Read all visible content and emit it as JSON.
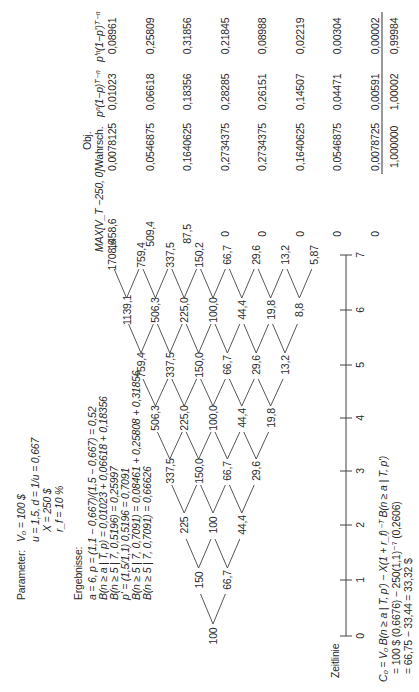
{
  "parameters": {
    "label": "Parameter:",
    "lines": [
      "V₀ = 100 $",
      "u = 1,5, d = 1/u = 0,667",
      "X = 250 $",
      "r_f = 10 %"
    ]
  },
  "results": {
    "label": "Ergebnisse:",
    "lines": [
      "a = 6, p = (1,1 − 0,667)/(1,5 − 0,667) = 0,52",
      "B(n ≥ a | T, p) = 0,01023 + 0,06618 + 0,18356",
      "B(n ≥ 5 | 7, 0,5196) = 0,25997",
      "p' = (1,5/1,1) 0,5196 = 0,7091",
      "B(n ≥ 5 | 7, 0,7091) = 0,08461 + 0,25808 + 0,31856",
      "B(n ≥ 5 | 7, 0,7091) = 0,66626"
    ]
  },
  "tree": {
    "levels": [
      [
        "100"
      ],
      [
        "150",
        "66,7"
      ],
      [
        "225",
        "100",
        "44,4"
      ],
      [
        "337,5",
        "150,0",
        "66,7",
        "29,6"
      ],
      [
        "506,3",
        "225,0",
        "100,0",
        "44,4",
        "19,8"
      ],
      [
        "759,4",
        "337,5",
        "150,0",
        "66,7",
        "29,6",
        "13,2"
      ],
      [
        "1139,1",
        "506,3",
        "225,0",
        "100,0",
        "44,4",
        "19,8",
        "8,8"
      ],
      [
        "1708,6",
        "759,4",
        "337,5",
        "150,2",
        "66,7",
        "29,6",
        "13,2",
        "5,87"
      ]
    ]
  },
  "table": {
    "headers": {
      "max": "MAX[V_T −250, 0]",
      "obj_top": "Obj.",
      "prob": "Wahrsch.",
      "pn": "pⁿ(1−p)ᵀ⁻ⁿ",
      "ppn": "p'ⁿ(1−p')ᵀ⁻ⁿ"
    },
    "rows": [
      [
        "1458,6",
        "0,0078125",
        "0,01023",
        "0,08961"
      ],
      [
        "509,4",
        "0,0546875",
        "0,06618",
        "0,25809"
      ],
      [
        "87,5",
        "0,1640625",
        "0,18356",
        "0,31856"
      ],
      [
        "0",
        "0,2734375",
        "0,28285",
        "0,21845"
      ],
      [
        "0",
        "0,2734375",
        "0,26151",
        "0,08988"
      ],
      [
        "0",
        "0,1640625",
        "0,14507",
        "0,02219"
      ],
      [
        "0",
        "0,0546875",
        "0,04471",
        "0,00304"
      ],
      [
        "0",
        "0,0078725",
        "0,00591",
        "0,00002"
      ]
    ],
    "sums": [
      "1,000000",
      "1,00002",
      "0,99984"
    ]
  },
  "timeline": {
    "label": "Zeitlinie",
    "ticks": [
      "0",
      "1",
      "2",
      "3",
      "4",
      "5",
      "6",
      "7"
    ]
  },
  "formula": {
    "lines": [
      "C₀ = V₀ B(n ≥ a | T, p') − X(1 + r_f)⁻ᵀ B(n ≥ a | T, p')",
      "= 100 $ (0,6676) − 250(1,1)⁻⁷ (0,2606)",
      "= 66,75 − 33,44 = 33,32 $"
    ]
  }
}
